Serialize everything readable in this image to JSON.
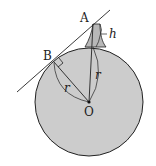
{
  "diagram": {
    "labels": {
      "A": "A",
      "B": "B",
      "O": "O",
      "h": "h",
      "r1": "r",
      "r2": "r"
    },
    "colors": {
      "earth_fill": "#cccccc",
      "stroke": "#222222",
      "background": "#ffffff"
    }
  }
}
